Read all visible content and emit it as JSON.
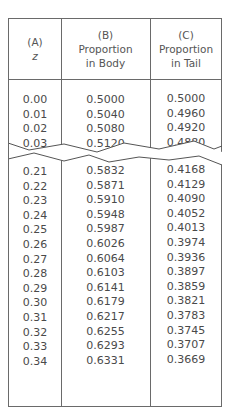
{
  "table": {
    "headers": [
      {
        "letter": "(A)",
        "line1": "z",
        "line2": ""
      },
      {
        "letter": "(B)",
        "line1": "Proportion",
        "line2": "in Body"
      },
      {
        "letter": "(C)",
        "line1": "Proportion",
        "line2": "in Tail"
      }
    ],
    "top_rows": {
      "z": [
        "0.00",
        "0.01",
        "0.02",
        "0.03"
      ],
      "body": [
        "0.5000",
        "0.5040",
        "0.5080",
        "0.5120"
      ],
      "tail": [
        "0.5000",
        "0.4960",
        "0.4920",
        "0.4880"
      ]
    },
    "bottom_rows": {
      "z": [
        "0.21",
        "0.22",
        "0.23",
        "0.24",
        "0.25",
        "0.26",
        "0.27",
        "0.28",
        "0.29",
        "0.30",
        "0.31",
        "0.32",
        "0.33",
        "0.34"
      ],
      "body": [
        "0.5832",
        "0.5871",
        "0.5910",
        "0.5948",
        "0.5987",
        "0.6026",
        "0.6064",
        "0.6103",
        "0.6141",
        "0.6179",
        "0.6217",
        "0.6255",
        "0.6293",
        "0.6331"
      ],
      "tail": [
        "0.4168",
        "0.4129",
        "0.4090",
        "0.4052",
        "0.4013",
        "0.3974",
        "0.3936",
        "0.3897",
        "0.3859",
        "0.3821",
        "0.3783",
        "0.3745",
        "0.3707",
        "0.3669"
      ]
    }
  }
}
